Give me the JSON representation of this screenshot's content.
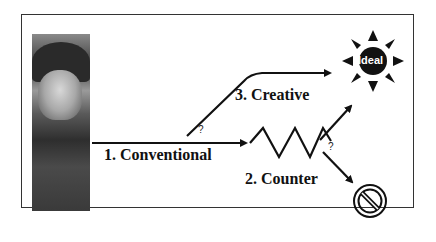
{
  "diagram": {
    "paths": [
      {
        "id": "conventional",
        "label": "1. Conventional"
      },
      {
        "id": "counter",
        "label": "2. Counter"
      },
      {
        "id": "creative",
        "label": "3. Creative"
      }
    ],
    "branch_marks": [
      "?",
      "?"
    ],
    "goal": {
      "label": "Ideal",
      "icon": "sun-icon"
    },
    "failure": {
      "icon": "prohibited-icon"
    },
    "portrait": {
      "icon": "portrait-image"
    }
  }
}
